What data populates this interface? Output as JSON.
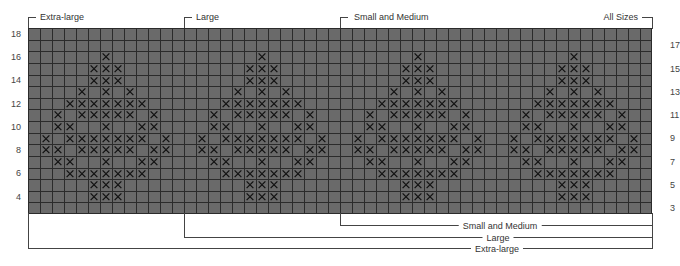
{
  "chart_data": {
    "type": "table",
    "grid": {
      "columns": 52,
      "rows": 16,
      "row_numbers_top_to_bottom": [
        18,
        17,
        16,
        15,
        14,
        13,
        12,
        11,
        10,
        9,
        8,
        7,
        6,
        5,
        4,
        3
      ],
      "left_row_labels": [
        "18",
        "16",
        "14",
        "12",
        "10",
        "8",
        "6",
        "4"
      ],
      "right_row_labels": [
        "17",
        "15",
        "13",
        "11",
        "9",
        "7",
        "5",
        "3"
      ]
    },
    "motif": {
      "description": "Diamond/tree motif of X stitches, repeated 4 times",
      "motif_center_columns": [
        6,
        19,
        32,
        45
      ],
      "rows": [
        {
          "row": 16,
          "offsets": [
            0
          ]
        },
        {
          "row": 15,
          "offsets": [
            -1,
            0,
            1
          ]
        },
        {
          "row": 14,
          "offsets": [
            -1,
            0,
            1
          ]
        },
        {
          "row": 13,
          "offsets": [
            -2,
            0,
            2
          ]
        },
        {
          "row": 12,
          "offsets": [
            -3,
            -2,
            -1,
            0,
            1,
            2,
            3
          ]
        },
        {
          "row": 11,
          "offsets": [
            -4,
            -2,
            -1,
            0,
            1,
            2,
            4
          ]
        },
        {
          "row": 10,
          "offsets": [
            -4,
            -3,
            0,
            3,
            4
          ]
        },
        {
          "row": 9,
          "offsets": [
            -5,
            -3,
            -2,
            -1,
            0,
            1,
            2,
            3,
            5
          ]
        },
        {
          "row": 8,
          "offsets": [
            -5,
            -4,
            -2,
            -1,
            0,
            1,
            2,
            4,
            5
          ]
        },
        {
          "row": 7,
          "offsets": [
            -4,
            -3,
            0,
            3,
            4
          ]
        },
        {
          "row": 6,
          "offsets": [
            -3,
            -2,
            -1,
            0,
            1,
            2,
            3
          ]
        },
        {
          "row": 5,
          "offsets": [
            -1,
            0,
            1
          ]
        },
        {
          "row": 4,
          "offsets": [
            -1,
            0,
            1
          ]
        }
      ]
    },
    "size_brackets_top": [
      {
        "label": "Extra-large",
        "start_col": 0
      },
      {
        "label": "Large",
        "start_col": 13
      },
      {
        "label": "Small and Medium",
        "start_col": 26
      },
      {
        "label": "All Sizes",
        "end_col": 52
      }
    ],
    "size_brackets_bottom": [
      {
        "label": "Small and Medium",
        "start_col": 26,
        "end_col": 52
      },
      {
        "label": "Large",
        "start_col": 13,
        "end_col": 52
      },
      {
        "label": "Extra-large",
        "start_col": 0,
        "end_col": 52
      }
    ]
  },
  "labels": {
    "top_extra_large": "Extra-large",
    "top_large": "Large",
    "top_small_medium": "Small and Medium",
    "top_all_sizes": "All Sizes",
    "bottom_small_medium": "Small and Medium",
    "bottom_large": "Large",
    "bottom_extra_large": "Extra-large"
  },
  "colors": {
    "cell_fill": "#6a6a6a",
    "grid_line": "#2b2b2b",
    "stitch_mark": "#111111"
  }
}
